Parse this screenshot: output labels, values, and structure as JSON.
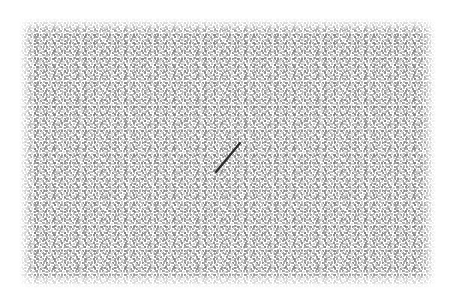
{
  "canvas": {
    "width": 456,
    "height": 305,
    "background_color": "#ffffff",
    "label": "Drawing canvas"
  },
  "texture": {
    "name": "halftone-dither-fill",
    "description": "Fine woven halftone grid of small gray cells",
    "cell_size_px": 2,
    "base_color": "#8d8d8d",
    "light_color": "#d7d7d7",
    "dark_color": "#6e6e6e",
    "region": {
      "x": 22,
      "y": 22,
      "width": 411,
      "height": 261
    },
    "feather_px": 8,
    "coverage_note": "soft faded edges on all four sides"
  },
  "strokes": [
    {
      "id": "stroke-1",
      "name": "diagonal-stroke",
      "type": "line",
      "x1": 216,
      "y1": 172,
      "x2": 240,
      "y2": 143,
      "color": "#2b2b2b",
      "width": 2.2,
      "length_px": 37.6,
      "angle_deg": -50.4
    }
  ]
}
